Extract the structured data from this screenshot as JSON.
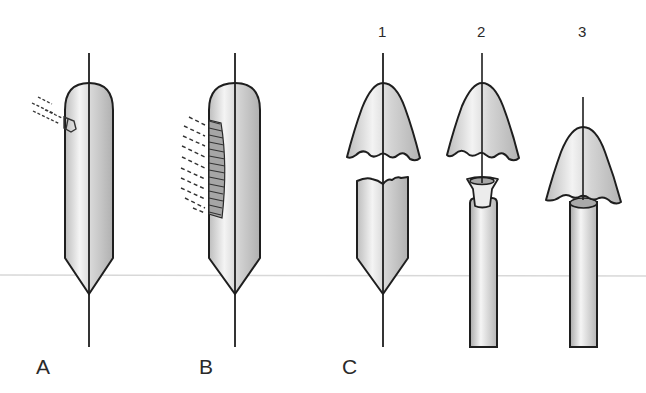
{
  "figure": {
    "panels": [
      {
        "id": "A",
        "label": "A",
        "description": "Intact capsule on axis with a small projectile impact at upper left"
      },
      {
        "id": "B",
        "label": "B",
        "description": "Intact capsule on axis with a hatched elongated contact region at left"
      },
      {
        "id": "C",
        "label": "C",
        "description": "Three-step sequence of capsule separation",
        "steps": [
          {
            "id": "1",
            "label": "1",
            "description": "Cap separated from lower pointed body with jagged break edges"
          },
          {
            "id": "2",
            "label": "2",
            "description": "Cap separated above a funnel-shaped piece sitting on a tube"
          },
          {
            "id": "3",
            "label": "3",
            "description": "Cap seated on top of a tube"
          }
        ]
      }
    ]
  },
  "colors": {
    "outline": "#1e1e1e",
    "fill_light": "#f2f2f2",
    "fill_dark": "#b8b8b8",
    "guide_line": "#d8d8d8",
    "label": "#2a2a2a"
  }
}
